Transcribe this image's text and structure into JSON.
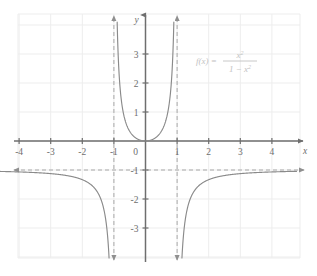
{
  "chart_data": {
    "type": "line",
    "title": "",
    "xlabel": "x",
    "ylabel": "y",
    "xlim": [
      -4.8,
      4.8
    ],
    "ylim": [
      -3.8,
      3.8
    ],
    "grid": true,
    "legend": "none",
    "annotation": {
      "text": "f(x) = x^2 / (1 - x^2)",
      "fn_prefix": "f(x) =",
      "numerator": "x",
      "numerator_exponent": "2",
      "denominator_lead": "1 − x",
      "denominator_exponent": "2",
      "x": 2.0,
      "y": 2.3,
      "color": "#c2c2c2"
    },
    "xticks": [
      -4,
      -3,
      -2,
      -1,
      0,
      1,
      2,
      3,
      4
    ],
    "xtick_labels": [
      "-4",
      "-3",
      "-2",
      "-1",
      "0",
      "1",
      "2",
      "3",
      "4"
    ],
    "yticks": [
      3,
      2,
      1,
      -1,
      -2,
      -3
    ],
    "ytick_labels": [
      "3",
      "2",
      "1",
      "-1",
      "-2",
      "-3"
    ],
    "origin_label": "0",
    "curve_color": "#8a8a8a",
    "axis_color": "#6e6e6e",
    "grid_color": "#ededed",
    "asymptote_color": "#a8a8a8",
    "asymptotes": [
      {
        "kind": "vertical",
        "value": -1,
        "style": "dashed",
        "arrows": "both"
      },
      {
        "kind": "vertical",
        "value": 1,
        "style": "dashed",
        "arrows": "both"
      },
      {
        "kind": "horizontal",
        "value": -1,
        "style": "dashed",
        "arrows": "both"
      }
    ],
    "series": [
      {
        "name": "left-branch",
        "domain": [
          -4.8,
          -1
        ],
        "points": [
          [
            -4.8,
            -0.957
          ],
          [
            -4.5,
            -0.95
          ],
          [
            -4.2,
            -0.9418
          ],
          [
            -3.9,
            -0.9321
          ],
          [
            -3.6,
            -0.9205
          ],
          [
            -3.3,
            -0.9063
          ],
          [
            -3.0,
            -0.8889
          ],
          [
            -2.8,
            -0.8742
          ],
          [
            -2.6,
            -0.8563
          ],
          [
            -2.4,
            -0.8343
          ],
          [
            -2.2,
            -0.8069
          ],
          [
            -2.0,
            -0.7722
          ],
          [
            -1.85,
            -0.7391
          ],
          [
            -1.7,
            -0.6955
          ],
          [
            -1.6,
            -0.6575
          ],
          [
            -1.5,
            -0.6103
          ],
          [
            -1.4,
            -0.5495
          ],
          [
            -1.32,
            -0.4886
          ],
          [
            -1.25,
            -0.4198
          ],
          [
            -1.2,
            -0.358
          ],
          [
            -1.15,
            -0.2786
          ],
          [
            -1.12,
            -0.2189
          ],
          [
            -1.09,
            -0.1457
          ],
          [
            -1.07,
            -0.0833
          ],
          [
            -1.05,
            -0.0122
          ],
          [
            -1.04,
            -0.027
          ],
          [
            -1.03,
            -0.066
          ],
          [
            -1.02,
            -0.1371
          ],
          [
            -1.015,
            -0.1853
          ],
          [
            -1.01,
            -0.2861
          ]
        ]
      },
      {
        "name": "center-branch",
        "domain": [
          -1,
          1
        ],
        "points": [
          [
            -0.99,
            3.8
          ],
          [
            -0.985,
            3.2
          ],
          [
            -0.98,
            2.65
          ],
          [
            -0.97,
            1.92
          ],
          [
            -0.96,
            1.5
          ],
          [
            -0.95,
            1.21
          ],
          [
            -0.93,
            0.85
          ],
          [
            -0.9,
            0.56
          ],
          [
            -0.86,
            0.38
          ],
          [
            -0.8,
            0.23
          ],
          [
            -0.7,
            0.127
          ],
          [
            -0.6,
            0.069
          ],
          [
            -0.5,
            0.033
          ],
          [
            -0.4,
            0.013
          ],
          [
            -0.3,
            0.005
          ],
          [
            -0.2,
            0.001
          ],
          [
            -0.1,
            0.0
          ],
          [
            0.0,
            0.0
          ],
          [
            0.1,
            0.0
          ],
          [
            0.2,
            0.001
          ],
          [
            0.3,
            0.005
          ],
          [
            0.4,
            0.013
          ],
          [
            0.5,
            0.033
          ],
          [
            0.6,
            0.069
          ],
          [
            0.7,
            0.127
          ],
          [
            0.8,
            0.23
          ],
          [
            0.86,
            0.38
          ],
          [
            0.9,
            0.56
          ],
          [
            0.93,
            0.85
          ],
          [
            0.95,
            1.21
          ],
          [
            0.96,
            1.5
          ],
          [
            0.97,
            1.92
          ],
          [
            0.98,
            2.65
          ],
          [
            0.985,
            3.2
          ],
          [
            0.99,
            3.8
          ]
        ]
      },
      {
        "name": "right-branch",
        "domain": [
          1,
          4.8
        ],
        "points": [
          [
            1.01,
            -0.2861
          ],
          [
            1.015,
            -0.1853
          ],
          [
            1.02,
            -0.1371
          ],
          [
            1.03,
            -0.066
          ],
          [
            1.04,
            -0.027
          ],
          [
            1.05,
            -0.0122
          ],
          [
            1.07,
            -0.0833
          ],
          [
            1.09,
            -0.1457
          ],
          [
            1.12,
            -0.2189
          ],
          [
            1.15,
            -0.2786
          ],
          [
            1.2,
            -0.358
          ],
          [
            1.25,
            -0.4198
          ],
          [
            1.32,
            -0.4886
          ],
          [
            1.4,
            -0.5495
          ],
          [
            1.5,
            -0.6103
          ],
          [
            1.6,
            -0.6575
          ],
          [
            1.7,
            -0.6955
          ],
          [
            1.85,
            -0.7391
          ],
          [
            2.0,
            -0.7722
          ],
          [
            2.2,
            -0.8069
          ],
          [
            2.4,
            -0.8343
          ],
          [
            2.6,
            -0.8563
          ],
          [
            2.8,
            -0.8742
          ],
          [
            3.0,
            -0.8889
          ],
          [
            3.3,
            -0.9063
          ],
          [
            3.6,
            -0.9205
          ],
          [
            3.9,
            -0.9321
          ],
          [
            4.2,
            -0.9418
          ],
          [
            4.5,
            -0.95
          ],
          [
            4.8,
            -0.957
          ]
        ]
      }
    ]
  }
}
